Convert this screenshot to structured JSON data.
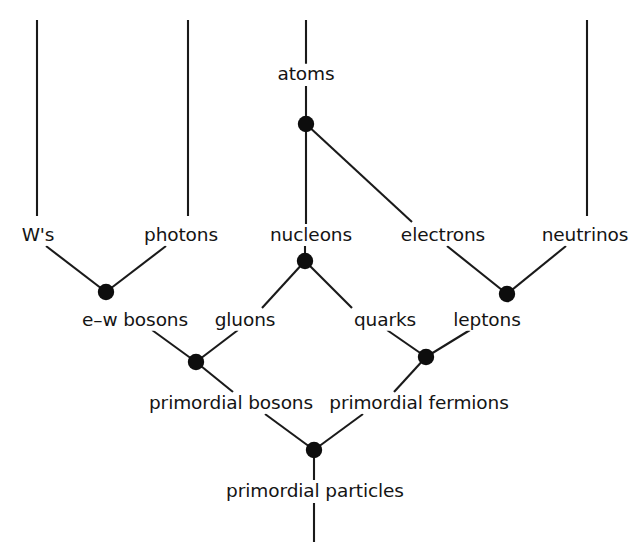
{
  "diagram": {
    "width": 636,
    "height": 559,
    "background_color": "#ffffff",
    "line_color": "#1a1a1a",
    "node_color": "#0d0d0d",
    "text_color": "#141414",
    "labels": {
      "atoms": "atoms",
      "ws": "W's",
      "photons": "photons",
      "nucleons": "nucleons",
      "electrons": "electrons",
      "neutrinos": "neutrinos",
      "ew_bosons": "e–w bosons",
      "gluons": "gluons",
      "quarks": "quarks",
      "leptons": "leptons",
      "primordial_bosons": "primordial bosons",
      "primordial_fermions": "primordial fermions",
      "primordial_particles": "primordial particles"
    },
    "label_positions": {
      "atoms": {
        "x": 306,
        "y": 74
      },
      "ws": {
        "x": 38,
        "y": 235
      },
      "photons": {
        "x": 181,
        "y": 235
      },
      "nucleons": {
        "x": 311,
        "y": 235
      },
      "electrons": {
        "x": 443,
        "y": 235
      },
      "neutrinos": {
        "x": 585,
        "y": 235
      },
      "ew_bosons": {
        "x": 135,
        "y": 320
      },
      "gluons": {
        "x": 245,
        "y": 320
      },
      "quarks": {
        "x": 385,
        "y": 320
      },
      "leptons": {
        "x": 487,
        "y": 320
      },
      "primordial_bosons": {
        "x": 231,
        "y": 403
      },
      "primordial_fermions": {
        "x": 419,
        "y": 403
      },
      "primordial_particles": {
        "x": 315,
        "y": 491
      }
    },
    "nodes": [
      {
        "name": "atoms-node",
        "x": 306,
        "y": 124,
        "r": 8.2
      },
      {
        "name": "nucleons-node",
        "x": 305,
        "y": 261,
        "r": 8.2
      },
      {
        "name": "ew-bosons-node",
        "x": 106,
        "y": 292,
        "r": 8.2
      },
      {
        "name": "leptons-node",
        "x": 507,
        "y": 294,
        "r": 8.2
      },
      {
        "name": "primordial-bosons-node",
        "x": 196,
        "y": 362,
        "r": 8.2
      },
      {
        "name": "primordial-fermions-node",
        "x": 426,
        "y": 357,
        "r": 8.2
      },
      {
        "name": "primordial-particles-node",
        "x": 314,
        "y": 450,
        "r": 8.2
      }
    ],
    "edges": [
      {
        "name": "edge-ws-stem",
        "x1": 37,
        "y1": 20,
        "x2": 37,
        "y2": 216
      },
      {
        "name": "edge-photons-stem",
        "x1": 188,
        "y1": 20,
        "x2": 188,
        "y2": 216
      },
      {
        "name": "edge-neutrinos-stem",
        "x1": 587,
        "y1": 20,
        "x2": 587,
        "y2": 216
      },
      {
        "name": "edge-atoms-stem",
        "x1": 306,
        "y1": 20,
        "x2": 306,
        "y2": 64
      },
      {
        "name": "edge-atoms-to-node",
        "x1": 306,
        "y1": 86,
        "x2": 306,
        "y2": 124
      },
      {
        "name": "edge-atoms-nucleons",
        "x1": 306,
        "y1": 124,
        "x2": 306,
        "y2": 224
      },
      {
        "name": "edge-atoms-electrons",
        "x1": 306,
        "y1": 124,
        "x2": 412,
        "y2": 222
      },
      {
        "name": "edge-ws-to-ewbosons",
        "x1": 46,
        "y1": 246,
        "x2": 106,
        "y2": 292
      },
      {
        "name": "edge-photons-to-ewbosons",
        "x1": 166,
        "y1": 246,
        "x2": 106,
        "y2": 292
      },
      {
        "name": "edge-nucleons-to-node",
        "x1": 305,
        "y1": 246,
        "x2": 305,
        "y2": 261
      },
      {
        "name": "edge-nucleons-gluons",
        "x1": 305,
        "y1": 261,
        "x2": 262,
        "y2": 308
      },
      {
        "name": "edge-nucleons-quarks",
        "x1": 305,
        "y1": 261,
        "x2": 352,
        "y2": 308
      },
      {
        "name": "edge-electrons-leptons",
        "x1": 447,
        "y1": 246,
        "x2": 507,
        "y2": 294
      },
      {
        "name": "edge-neutrinos-leptons",
        "x1": 566,
        "y1": 246,
        "x2": 507,
        "y2": 294
      },
      {
        "name": "edge-ewbosons-primbosons",
        "x1": 152,
        "y1": 330,
        "x2": 196,
        "y2": 362
      },
      {
        "name": "edge-gluons-primbosons",
        "x1": 238,
        "y1": 330,
        "x2": 196,
        "y2": 362
      },
      {
        "name": "edge-quarks-primfermions",
        "x1": 387,
        "y1": 330,
        "x2": 426,
        "y2": 357
      },
      {
        "name": "edge-leptons-primfermions",
        "x1": 470,
        "y1": 330,
        "x2": 426,
        "y2": 357
      },
      {
        "name": "edge-primbosons-down",
        "x1": 196,
        "y1": 362,
        "x2": 233,
        "y2": 392
      },
      {
        "name": "edge-primfermions-down",
        "x1": 426,
        "y1": 357,
        "x2": 394,
        "y2": 392
      },
      {
        "name": "edge-primbosons-to-particles",
        "x1": 265,
        "y1": 414,
        "x2": 314,
        "y2": 450
      },
      {
        "name": "edge-primfermions-to-particles",
        "x1": 363,
        "y1": 414,
        "x2": 314,
        "y2": 450
      },
      {
        "name": "edge-particles-to-label",
        "x1": 314,
        "y1": 450,
        "x2": 314,
        "y2": 480
      },
      {
        "name": "edge-particles-stem-down",
        "x1": 314,
        "y1": 503,
        "x2": 314,
        "y2": 542
      }
    ]
  }
}
